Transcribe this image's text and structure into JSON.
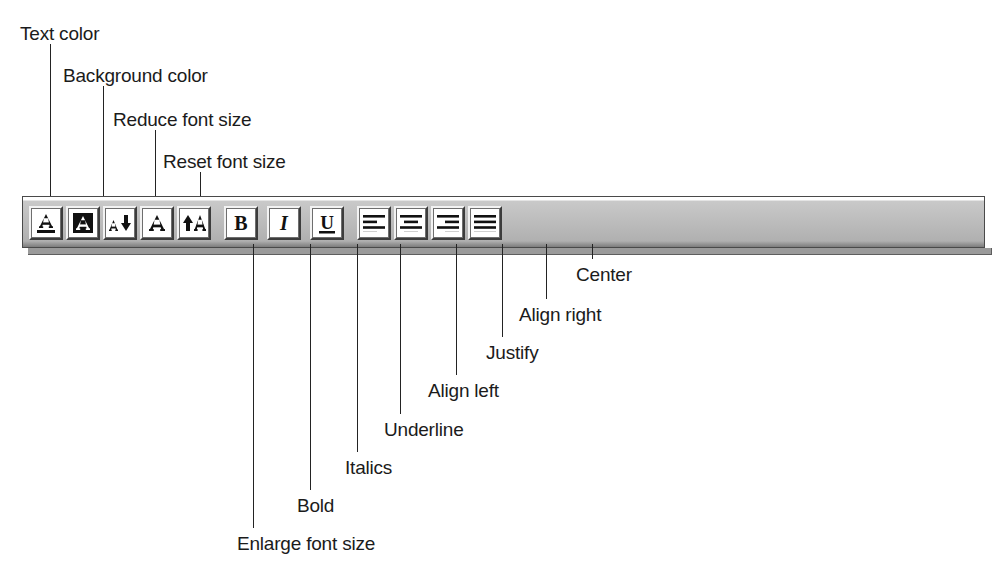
{
  "figure": {
    "kind": "annotated-toolbar-diagram",
    "background_color": "#ffffff",
    "line_color": "#232323"
  },
  "toolbar": {
    "name": "formatting-toolbar",
    "face_color": "#b0b0b0",
    "button_face_color": "#ffffff",
    "buttons": [
      {
        "id": "text-color",
        "icon": "text-color-icon",
        "label": "Text color"
      },
      {
        "id": "background-color",
        "icon": "background-color-icon",
        "label": "Background color"
      },
      {
        "id": "reduce-font-size",
        "icon": "reduce-font-size-icon",
        "label": "Reduce font size"
      },
      {
        "id": "reset-font-size",
        "icon": "reset-font-size-icon",
        "label": "Reset font size"
      },
      {
        "id": "enlarge-font-size",
        "icon": "enlarge-font-size-icon",
        "label": "Enlarge font size"
      },
      {
        "id": "bold",
        "icon": "bold-icon",
        "label": "Bold"
      },
      {
        "id": "italics",
        "icon": "italics-icon",
        "label": "Italics"
      },
      {
        "id": "underline",
        "icon": "underline-icon",
        "label": "Underline"
      },
      {
        "id": "align-left",
        "icon": "align-left-icon",
        "label": "Align left"
      },
      {
        "id": "center",
        "icon": "align-center-icon",
        "label": "Center"
      },
      {
        "id": "align-right",
        "icon": "align-right-icon",
        "label": "Align right"
      },
      {
        "id": "justify",
        "icon": "justify-icon",
        "label": "Justify"
      }
    ]
  },
  "callouts_top": [
    {
      "id": "text-color",
      "text": "Text color",
      "label_x": 20,
      "label_y": 24,
      "line_x": 50,
      "line_top": 44,
      "line_bottom": 214
    },
    {
      "id": "background-color",
      "text": "Background color",
      "label_x": 63,
      "label_y": 66,
      "line_x": 103,
      "line_top": 86,
      "line_bottom": 214
    },
    {
      "id": "reduce-font-size",
      "text": "Reduce font size",
      "label_x": 113,
      "label_y": 110,
      "line_x": 155,
      "line_top": 130,
      "line_bottom": 214
    },
    {
      "id": "reset-font-size",
      "text": "Reset font size",
      "label_x": 163,
      "label_y": 152,
      "line_x": 200,
      "line_top": 172,
      "line_bottom": 214
    }
  ],
  "callouts_bottom": [
    {
      "id": "enlarge-font-size",
      "text": "Enlarge font size",
      "label_x": 237,
      "label_y": 534,
      "line_x": 253,
      "line_top": 244,
      "line_bottom": 528
    },
    {
      "id": "bold",
      "text": "Bold",
      "label_x": 297,
      "label_y": 496,
      "line_x": 310,
      "line_top": 244,
      "line_bottom": 490
    },
    {
      "id": "italics",
      "text": "Italics",
      "label_x": 345,
      "label_y": 458,
      "line_x": 357,
      "line_top": 244,
      "line_bottom": 452
    },
    {
      "id": "underline",
      "text": "Underline",
      "label_x": 384,
      "label_y": 420,
      "line_x": 400,
      "line_top": 244,
      "line_bottom": 414
    },
    {
      "id": "align-left",
      "text": "Align left",
      "label_x": 428,
      "label_y": 381,
      "line_x": 456,
      "line_top": 244,
      "line_bottom": 375
    },
    {
      "id": "justify",
      "text": "Justify",
      "label_x": 486,
      "label_y": 343,
      "line_x": 502,
      "line_top": 244,
      "line_bottom": 337
    },
    {
      "id": "align-right",
      "text": "Align right",
      "label_x": 519,
      "label_y": 305,
      "line_x": 546,
      "line_top": 244,
      "line_bottom": 299
    },
    {
      "id": "center",
      "text": "Center",
      "label_x": 576,
      "label_y": 265,
      "line_x": 592,
      "line_top": 244,
      "line_bottom": 259
    }
  ]
}
